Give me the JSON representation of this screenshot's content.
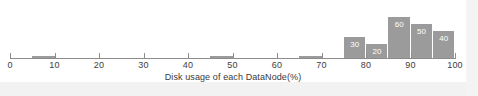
{
  "chart_data": {
    "type": "bar",
    "title": "",
    "subtitle": "",
    "xlabel": "Disk usage of each DataNode(%)",
    "ylabel": "",
    "xlim": [
      0,
      100
    ],
    "ylim": [
      0,
      70
    ],
    "grid": false,
    "legend": null,
    "xticks": [
      0,
      10,
      20,
      30,
      40,
      50,
      60,
      70,
      80,
      90,
      100
    ],
    "xtick_labels": [
      "0",
      "10",
      "20",
      "30",
      "40",
      "50",
      "60",
      "70",
      "80",
      "90",
      "100"
    ],
    "bin_width": 5,
    "bars": [
      {
        "bin_start": 5,
        "bin_end": 10,
        "value": 0,
        "label": ""
      },
      {
        "bin_start": 45,
        "bin_end": 50,
        "value": 0,
        "label": ""
      },
      {
        "bin_start": 65,
        "bin_end": 70,
        "value": 0,
        "label": ""
      },
      {
        "bin_start": 75,
        "bin_end": 80,
        "value": 30,
        "label": "30"
      },
      {
        "bin_start": 80,
        "bin_end": 85,
        "value": 20,
        "label": "20"
      },
      {
        "bin_start": 85,
        "bin_end": 90,
        "value": 60,
        "label": "60"
      },
      {
        "bin_start": 90,
        "bin_end": 95,
        "value": 50,
        "label": "50"
      },
      {
        "bin_start": 95,
        "bin_end": 100,
        "value": 40,
        "label": "40"
      }
    ],
    "categories": [
      "5-10",
      "45-50",
      "65-70",
      "75-80",
      "80-85",
      "85-90",
      "90-95",
      "95-100"
    ],
    "values": [
      0,
      0,
      0,
      30,
      20,
      60,
      50,
      40
    ],
    "colors": {
      "bar_fill": "#9b9b9b",
      "bar_label": "#ffffff",
      "axis": "#8c8c8c",
      "tick_text": "#3d3d3d",
      "axis_label": "#3a3a3a",
      "background": "#ffffff"
    }
  }
}
